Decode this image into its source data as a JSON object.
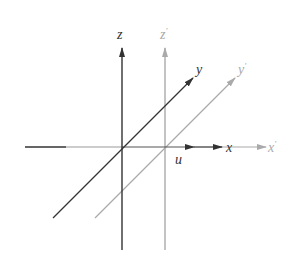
{
  "diagram": {
    "colors": {
      "primary": "#333333",
      "translated": "#aaaaaa"
    },
    "original_frame": {
      "x_label": "x",
      "y_label": "y",
      "z_label": "z"
    },
    "translated_frame": {
      "x_label": "x",
      "y_label": "y",
      "z_label": "z",
      "prime": "′"
    },
    "translation_label": "u"
  }
}
